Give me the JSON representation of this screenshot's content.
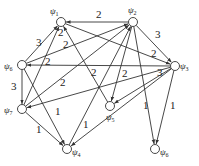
{
  "diagram": {
    "type": "weighted-directed-graph",
    "nodes": [
      {
        "id": "psi1",
        "label": "ψ",
        "sub": "1",
        "x": 61,
        "y": 22,
        "lx": 50,
        "ly": 14
      },
      {
        "id": "psi2",
        "label": "ψ",
        "sub": "2",
        "x": 133,
        "y": 22,
        "lx": 128,
        "ly": 13
      },
      {
        "id": "psi3",
        "label": "ψ",
        "sub": "3",
        "x": 175,
        "y": 66,
        "lx": 180,
        "ly": 69
      },
      {
        "id": "psi6",
        "label": "ψ",
        "sub": "6",
        "x": 22,
        "y": 65,
        "lx": 4,
        "ly": 69
      },
      {
        "id": "psi7",
        "label": "ψ",
        "sub": "7",
        "x": 22,
        "y": 109,
        "lx": 4,
        "ly": 113
      },
      {
        "id": "psi5",
        "label": "ψ",
        "sub": "5",
        "x": 110,
        "y": 106,
        "lx": 106,
        "ly": 120
      },
      {
        "id": "psi4",
        "label": "ψ",
        "sub": "4",
        "x": 67,
        "y": 149,
        "lx": 72,
        "ly": 155
      },
      {
        "id": "psi8",
        "label": "ψ",
        "sub": "6",
        "x": 155,
        "y": 149,
        "lx": 160,
        "ly": 155
      }
    ],
    "edges": [
      {
        "from": "psi2",
        "to": "psi1",
        "weight": "2",
        "lx": 96,
        "ly": 18
      },
      {
        "from": "psi6",
        "to": "psi1",
        "weight": "3",
        "lx": 36,
        "ly": 46
      },
      {
        "from": "psi3",
        "to": "psi6",
        "weight": "2",
        "lx": 63,
        "ly": 48
      },
      {
        "from": "psi7",
        "to": "psi1",
        "weight": "2",
        "lx": 45,
        "ly": 65
      },
      {
        "from": "psi5",
        "to": "psi1",
        "weight": "2",
        "lx": 91,
        "ly": 76
      },
      {
        "from": "psi1",
        "to": "psi3",
        "weight": "2",
        "lx": 151,
        "ly": 57
      },
      {
        "from": "psi2",
        "to": "psi3",
        "weight": "3",
        "lx": 155,
        "ly": 38
      },
      {
        "from": "psi6",
        "to": "psi2",
        "weight": "2",
        "lx": 58,
        "ly": 36
      },
      {
        "from": "psi7",
        "to": "psi2",
        "weight": "2",
        "lx": 0,
        "ly": 0,
        "hidden": true
      },
      {
        "from": "psi4",
        "to": "psi2",
        "weight": "",
        "lx": 0,
        "ly": 0
      },
      {
        "from": "psi6",
        "to": "psi7",
        "weight": "3",
        "lx": 11,
        "ly": 90
      },
      {
        "from": "psi3",
        "to": "psi7",
        "weight": "2",
        "lx": 60,
        "ly": 86
      },
      {
        "from": "psi6",
        "to": "psi4",
        "weight": "1",
        "lx": 55,
        "ly": 115
      },
      {
        "from": "psi7",
        "to": "psi4",
        "weight": "1",
        "lx": 36,
        "ly": 133
      },
      {
        "from": "psi2",
        "to": "psi5",
        "weight": "2",
        "lx": 122,
        "ly": 77
      },
      {
        "from": "psi3",
        "to": "psi5",
        "weight": "3",
        "lx": 157,
        "ly": 76
      },
      {
        "from": "psi3",
        "to": "psi4",
        "weight": "1",
        "lx": 83,
        "ly": 128
      },
      {
        "from": "psi2",
        "to": "psi8",
        "weight": "1",
        "lx": 143,
        "ly": 109
      },
      {
        "from": "psi3",
        "to": "psi8",
        "weight": "1",
        "lx": 170,
        "ly": 109
      }
    ]
  },
  "colors": {
    "stroke": "#333333",
    "background": "#ffffff"
  }
}
